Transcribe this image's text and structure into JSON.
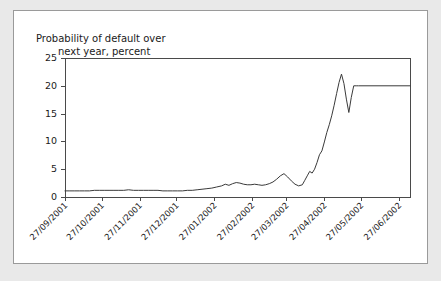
{
  "card": {
    "background_color": "#ffffff",
    "border_color": "#9a9a9a",
    "page_background_color": "#e9e9e9"
  },
  "chart_data": {
    "type": "line",
    "title": "Probability of default over next year, percent",
    "title_line_1": "Probability of default over",
    "title_line_2": "next year, percent",
    "xlabel": "",
    "ylabel": "",
    "ylim": [
      0,
      25
    ],
    "yticks": [
      0,
      5,
      10,
      15,
      20,
      25
    ],
    "ytick_labels": [
      "0",
      "5",
      "10",
      "15",
      "20",
      "25"
    ],
    "grid": false,
    "legend": null,
    "line_color": "#3a3a3a",
    "axis_color": "#4a4a4a",
    "xtick_labels": [
      "27/09/2001",
      "27/10/2001",
      "27/11/2001",
      "27/12/2001",
      "27/01/2002",
      "27/02/2002",
      "27/03/2002",
      "27/04/2002",
      "27/05/2002",
      "27/06/2002"
    ],
    "xtick_positions": [
      0,
      30,
      61,
      91,
      122,
      153,
      181,
      212,
      242,
      273
    ],
    "x_range": [
      0,
      282
    ],
    "x_unit": "days since 27/09/2001",
    "series": [
      {
        "name": "Probability of default over next year",
        "x": [
          0,
          4,
          8,
          12,
          16,
          20,
          24,
          28,
          32,
          36,
          40,
          44,
          48,
          52,
          56,
          60,
          64,
          68,
          72,
          76,
          80,
          84,
          88,
          92,
          96,
          100,
          104,
          108,
          112,
          116,
          120,
          124,
          128,
          131,
          134,
          137,
          140,
          143,
          146,
          149,
          152,
          155,
          158,
          161,
          164,
          167,
          170,
          173,
          176,
          179,
          182,
          185,
          188,
          191,
          194,
          196,
          198,
          200,
          202,
          204,
          206,
          208,
          210,
          212,
          214,
          216,
          218,
          220,
          222,
          224,
          226,
          228,
          230,
          232,
          234,
          236,
          238,
          240,
          282
        ],
        "values": [
          1.1,
          1.1,
          1.1,
          1.1,
          1.1,
          1.1,
          1.2,
          1.2,
          1.2,
          1.2,
          1.2,
          1.2,
          1.2,
          1.3,
          1.2,
          1.2,
          1.2,
          1.2,
          1.2,
          1.2,
          1.1,
          1.1,
          1.1,
          1.1,
          1.1,
          1.2,
          1.2,
          1.3,
          1.4,
          1.5,
          1.6,
          1.8,
          2.0,
          2.3,
          2.1,
          2.4,
          2.6,
          2.5,
          2.3,
          2.2,
          2.2,
          2.3,
          2.2,
          2.1,
          2.2,
          2.4,
          2.7,
          3.2,
          3.8,
          4.2,
          3.6,
          2.9,
          2.3,
          2.0,
          2.2,
          3.0,
          3.8,
          4.6,
          4.3,
          5.0,
          6.2,
          7.6,
          8.3,
          9.9,
          11.6,
          13.0,
          14.6,
          16.5,
          18.6,
          20.6,
          22.1,
          20.4,
          17.6,
          15.2,
          17.9,
          20.0,
          20.0,
          20.0,
          20.0
        ],
        "final_plateau_value": 20.0,
        "peak_value": 22.1,
        "min_value": 1.1
      }
    ]
  }
}
